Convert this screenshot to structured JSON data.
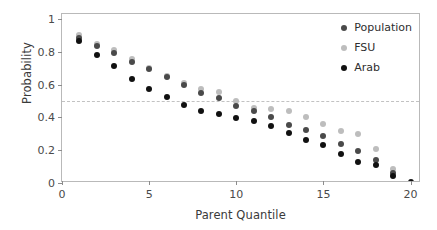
{
  "chart_data": {
    "type": "scatter",
    "title": "",
    "xlabel": "Parent Quantile",
    "ylabel": "Probability",
    "xlim": [
      0,
      20.6
    ],
    "ylim": [
      0,
      1.03
    ],
    "xticks": [
      "0",
      "5",
      "10",
      "15",
      "20"
    ],
    "xtick_values": [
      0,
      5,
      10,
      15,
      20
    ],
    "yticks": [
      "0",
      "0.2",
      "0.4",
      "0.6",
      "0.8",
      "1"
    ],
    "ytick_values": [
      0,
      0.2,
      0.4,
      0.6,
      0.8,
      1
    ],
    "grid": false,
    "legend_position": "top-right",
    "annotations": [
      {
        "type": "hline",
        "value": 0.5,
        "style": "dashed",
        "color": "#c2c2c2"
      }
    ],
    "x": [
      1,
      2,
      3,
      4,
      5,
      6,
      7,
      8,
      9,
      10,
      11,
      12,
      13,
      14,
      15,
      16,
      17,
      18,
      19,
      20
    ],
    "series": [
      {
        "name": "Population",
        "color": "#4a4a4a",
        "values": [
          0.885,
          0.835,
          0.795,
          0.735,
          0.695,
          0.645,
          0.595,
          0.55,
          0.52,
          0.47,
          0.44,
          0.4,
          0.355,
          0.32,
          0.285,
          0.235,
          0.195,
          0.14,
          0.06,
          null
        ]
      },
      {
        "name": "FSU",
        "color": "#bdbdbd",
        "values": [
          0.905,
          0.845,
          0.81,
          0.755,
          0.7,
          0.655,
          0.61,
          0.57,
          0.555,
          0.5,
          0.455,
          0.45,
          0.44,
          0.4,
          0.36,
          0.315,
          0.3,
          0.21,
          0.085,
          null
        ]
      },
      {
        "name": "Arab",
        "color": "#111111",
        "values": [
          0.865,
          0.78,
          0.715,
          0.635,
          0.57,
          0.525,
          0.475,
          0.44,
          0.42,
          0.395,
          0.38,
          0.35,
          0.305,
          0.265,
          0.23,
          0.175,
          0.125,
          0.11,
          0.04,
          0.005
        ]
      }
    ]
  },
  "legend": {
    "items": [
      {
        "label": "Population",
        "color": "#4a4a4a"
      },
      {
        "label": "FSU",
        "color": "#bdbdbd"
      },
      {
        "label": "Arab",
        "color": "#111111"
      }
    ]
  }
}
